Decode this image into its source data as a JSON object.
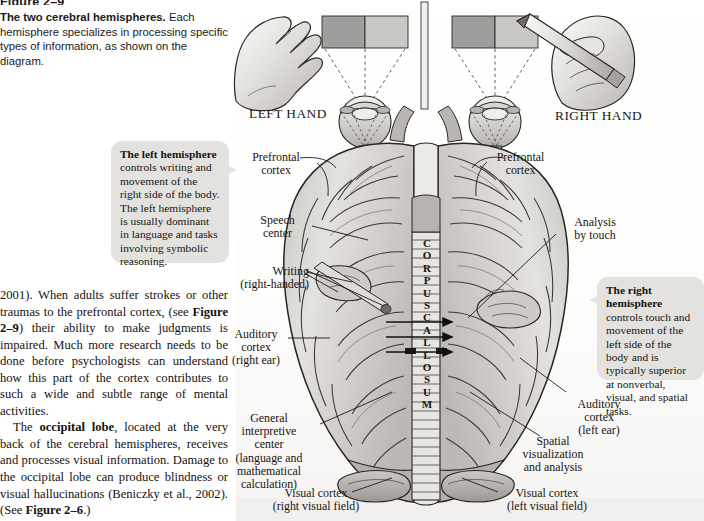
{
  "figure": {
    "number": "Figure 2–9",
    "caption_bold": "The two cerebral hemispheres.",
    "caption_rest": " Each hemisphere specializes in processing specific types of information, as shown on the diagram."
  },
  "body_text": {
    "paragraph_1": "2001). When adults suffer strokes or other traumas to the prefrontal cortex, (see Figure 2–9) their ability to make judgments is impaired. Much more research needs to be done before psychologists can understand how this part of the cortex contributes to such a wide and subtle range of mental activities.",
    "paragraph_2": "The occipital lobe, located at the very back of the cerebral hemispheres, receives and processes visual information. Damage to the occipital lobe can produce blindness or visual hallucinations (Beniczky et al., 2002). (See Figure 2–6.)"
  },
  "callouts": {
    "left": {
      "title": "The left hemisphere",
      "text": " controls writing and movement of the right side of the body. The left hemisphere is usually dominant in language and tasks involving symbolic reasoning."
    },
    "right": {
      "title": "The right hemisphere",
      "text": " controls touch and movement of the left side of the body and is typically superior at nonverbal, visual, and spatial tasks."
    }
  },
  "diagram": {
    "hand_left": "LEFT HAND",
    "hand_right": "RIGHT HAND",
    "corpus_callosum": "CORPUS CALLOSUM",
    "labels_left": {
      "prefrontal": "Prefrontal\ncortex",
      "speech": "Speech\ncenter",
      "writing": "Writing\n(right-handed)",
      "auditory": "Auditory\ncortex\n(right ear)",
      "general": "General\ninterpretive\ncenter\n(language and\nmathematical\ncalculation)",
      "visual": "Visual cortex\n(right visual field)"
    },
    "labels_right": {
      "prefrontal": "Prefrontal\ncortex",
      "analysis": "Analysis\nby touch",
      "auditory": "Auditory\ncortex\n(left ear)",
      "spatial": "Spatial\nvisualization\nand analysis",
      "visual": "Visual cortex\n(left visual field)"
    }
  },
  "colors": {
    "page_background": "#ffffff",
    "callout_background": "#e3e2df",
    "brain_fill": "#d6d4d0",
    "brain_stroke": "#2a2722",
    "card_gray": "#9a9a98",
    "text": "#16140f"
  }
}
